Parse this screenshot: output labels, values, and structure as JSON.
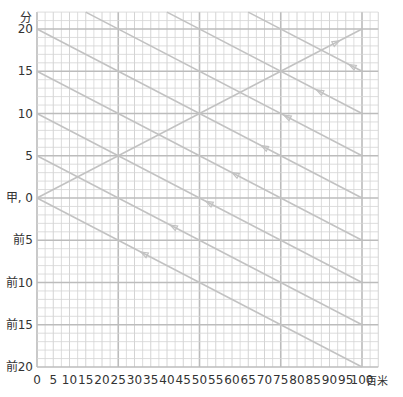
{
  "chart_data": {
    "type": "line",
    "title": "",
    "xlabel": "百米",
    "ylabel": "分",
    "x_ticks": [
      "0",
      "5",
      "10",
      "15",
      "20",
      "25",
      "30",
      "35",
      "40",
      "45",
      "50",
      "55",
      "60",
      "65",
      "70",
      "75",
      "80",
      "85",
      "90",
      "95",
      "100"
    ],
    "y_ticks": [
      {
        "value": 20,
        "label": "20"
      },
      {
        "value": 15,
        "label": "15"
      },
      {
        "value": 10,
        "label": "10"
      },
      {
        "value": 5,
        "label": "5"
      },
      {
        "value": 0,
        "label": "甲, 0"
      },
      {
        "value": -5,
        "label": "前5"
      },
      {
        "value": -10,
        "label": "前10"
      },
      {
        "value": -15,
        "label": "前15"
      },
      {
        "value": -20,
        "label": "前20"
      }
    ],
    "xlim": [
      0,
      105
    ],
    "ylim": [
      -20,
      22
    ],
    "grid": true,
    "series": [
      {
        "name": "ascending",
        "x": [
          0,
          100
        ],
        "y": [
          0,
          20
        ],
        "arrow_at": 93,
        "arrow_dir": "forward"
      },
      {
        "name": "descending-35",
        "x": [
          0,
          100
        ],
        "y": [
          35,
          15
        ],
        "arrow_at": 96,
        "arrow_dir": "backward"
      },
      {
        "name": "descending-30",
        "x": [
          0,
          100
        ],
        "y": [
          30,
          10
        ],
        "arrow_at": 86,
        "arrow_dir": "backward"
      },
      {
        "name": "descending-25",
        "x": [
          0,
          100
        ],
        "y": [
          25,
          5
        ],
        "arrow_at": 76,
        "arrow_dir": "backward"
      },
      {
        "name": "descending-20",
        "x": [
          0,
          100
        ],
        "y": [
          20,
          0
        ],
        "arrow_at": 69,
        "arrow_dir": "backward"
      },
      {
        "name": "descending-15",
        "x": [
          0,
          100
        ],
        "y": [
          15,
          -5
        ],
        "arrow_at": 60,
        "arrow_dir": "backward"
      },
      {
        "name": "descending-10",
        "x": [
          0,
          100
        ],
        "y": [
          10,
          -10
        ],
        "arrow_at": 52,
        "arrow_dir": "backward"
      },
      {
        "name": "descending-5",
        "x": [
          0,
          100
        ],
        "y": [
          5,
          -15
        ],
        "arrow_at": 41,
        "arrow_dir": "backward"
      },
      {
        "name": "descending-0",
        "x": [
          0,
          100
        ],
        "y": [
          0,
          -20
        ],
        "arrow_at": 32,
        "arrow_dir": "backward"
      }
    ]
  },
  "colors": {
    "grid_minor": "#d4d4d4",
    "grid_major": "#bcbcbc",
    "line": "#c2c2c2",
    "text": "#333333"
  }
}
